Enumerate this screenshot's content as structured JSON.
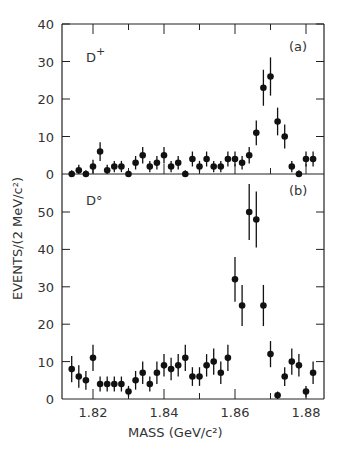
{
  "chart_data": [
    {
      "type": "scatter",
      "panel_label": "(a)",
      "particle_label": "D⁺",
      "title": "",
      "xlabel": "MASS (GeV/c²)",
      "ylabel": "EVENTS/(2 MeV/c²)",
      "xlim": [
        1.812,
        1.882
      ],
      "ylim": [
        0,
        40
      ],
      "yticks": [
        0,
        10,
        20,
        30,
        40
      ],
      "x": [
        1.814,
        1.816,
        1.818,
        1.82,
        1.822,
        1.824,
        1.826,
        1.828,
        1.83,
        1.832,
        1.834,
        1.836,
        1.838,
        1.84,
        1.842,
        1.844,
        1.846,
        1.848,
        1.85,
        1.852,
        1.854,
        1.856,
        1.858,
        1.86,
        1.862,
        1.864,
        1.866,
        1.868,
        1.87,
        1.872,
        1.874,
        1.876,
        1.878,
        1.88,
        1.882
      ],
      "values": [
        0,
        1,
        0,
        2,
        6,
        1,
        2,
        2,
        0,
        3,
        5,
        2,
        3,
        5,
        2,
        3,
        0,
        4,
        2,
        4,
        2,
        2,
        4,
        4,
        3,
        5,
        11,
        23,
        26,
        14,
        10,
        2,
        0,
        4,
        4
      ],
      "errors": [
        1,
        1.5,
        1,
        1.8,
        2.5,
        1.5,
        1.5,
        1.5,
        1,
        1.8,
        2.2,
        1.5,
        1.8,
        2.2,
        1.5,
        1.8,
        1,
        2,
        1.5,
        2,
        1.5,
        1.5,
        2,
        2,
        1.8,
        2.2,
        3.3,
        4.8,
        5.1,
        3.7,
        3.2,
        1.5,
        1,
        2,
        2
      ]
    },
    {
      "type": "scatter",
      "panel_label": "(b)",
      "particle_label": "D°",
      "title": "",
      "xlabel": "MASS (GeV/c²)",
      "ylabel": "EVENTS/(2 MeV/c²)",
      "xlim": [
        1.812,
        1.882
      ],
      "ylim": [
        0,
        58
      ],
      "yticks": [
        0,
        10,
        20,
        30,
        40,
        50
      ],
      "xticks": [
        1.82,
        1.84,
        1.86,
        1.88
      ],
      "x": [
        1.814,
        1.816,
        1.818,
        1.82,
        1.822,
        1.824,
        1.826,
        1.828,
        1.83,
        1.832,
        1.834,
        1.836,
        1.838,
        1.84,
        1.842,
        1.844,
        1.846,
        1.848,
        1.85,
        1.852,
        1.854,
        1.856,
        1.858,
        1.86,
        1.862,
        1.864,
        1.866,
        1.868,
        1.87,
        1.872,
        1.874,
        1.876,
        1.878,
        1.88,
        1.882
      ],
      "values": [
        8,
        6,
        5,
        11,
        4,
        4,
        4,
        4,
        2,
        5,
        7,
        4,
        7,
        9,
        8,
        9,
        11,
        6,
        6,
        9,
        10,
        7,
        11,
        32,
        25,
        50,
        48,
        25,
        12,
        1,
        6,
        10,
        9,
        2,
        7
      ],
      "errors": [
        3.5,
        3,
        2.5,
        3.5,
        2,
        2,
        2,
        2,
        1.5,
        2.5,
        3,
        2,
        3,
        3,
        3,
        3,
        3.5,
        2.5,
        2.5,
        3,
        3.5,
        3,
        3.5,
        6,
        5.5,
        7.5,
        7.5,
        5.5,
        3.5,
        1,
        2.5,
        3.5,
        3,
        1.5,
        3
      ]
    }
  ],
  "axes": {
    "ylabel": "EVENTS/(2 MeV/c²)",
    "xlabel": "MASS   (GeV/c²)",
    "xtick_labels": [
      "1.82",
      "1.84",
      "1.86",
      "1.88"
    ],
    "top_ytick_labels": [
      "40",
      "30",
      "20",
      "10",
      "0"
    ],
    "bottom_ytick_labels": [
      "50",
      "40",
      "30",
      "20",
      "10",
      "0"
    ]
  },
  "panels": {
    "a": {
      "tag": "(a)",
      "particle": "D+"
    },
    "b": {
      "tag": "(b)",
      "particle": "D°"
    }
  }
}
